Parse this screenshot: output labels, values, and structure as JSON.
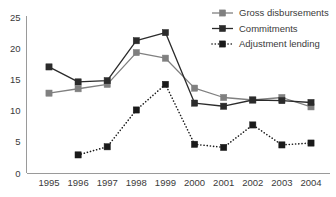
{
  "chart_data": {
    "type": "line",
    "title": "",
    "subtitle": "",
    "xlabel": "",
    "ylabel": "",
    "categories": [
      "1995",
      "1996",
      "1997",
      "1998",
      "1999",
      "2000",
      "2001",
      "2002",
      "2003",
      "2004"
    ],
    "ylim": [
      0,
      25
    ],
    "yticks": [
      0,
      5,
      10,
      15,
      20,
      25
    ],
    "ytick_labels": [
      "0",
      "5",
      "10",
      "15",
      "20",
      "25"
    ],
    "grid": false,
    "legend_position": "top-right",
    "series": [
      {
        "name": "Gross disbursements",
        "color": "#808080",
        "line_style": "solid",
        "marker": "square",
        "values": [
          12.8,
          13.5,
          14.2,
          19.3,
          18.4,
          13.6,
          12.1,
          11.7,
          12.1,
          10.6
        ]
      },
      {
        "name": "Commitments",
        "color": "#2b2b2b",
        "line_style": "solid",
        "marker": "square",
        "values": [
          17.0,
          14.6,
          14.8,
          21.2,
          22.5,
          11.2,
          10.7,
          11.7,
          11.6,
          11.3
        ]
      },
      {
        "name": "Adjustment lending",
        "color": "#1a1a1a",
        "line_style": "dotted",
        "marker": "square",
        "values": [
          null,
          2.9,
          4.2,
          10.1,
          14.2,
          4.6,
          4.1,
          7.7,
          4.5,
          4.8
        ]
      }
    ]
  },
  "legend": {
    "items": [
      {
        "label": "Gross disbursements"
      },
      {
        "label": "Commitments"
      },
      {
        "label": "Adjustment lending"
      }
    ]
  },
  "axes": {
    "y_axis_name": "value-axis",
    "x_axis_name": "year-axis"
  }
}
